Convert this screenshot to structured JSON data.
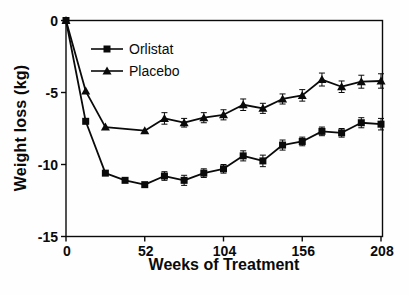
{
  "figure": {
    "background": "#fefefe",
    "ink_color": "#0a0a0a"
  },
  "axis": {
    "y_title": "Weight loss (kg)",
    "x_title": "Weeks of Treatment"
  },
  "legend": {
    "items": [
      {
        "label": "Orlistat",
        "marker": "square-marker-icon"
      },
      {
        "label": "Placebo",
        "marker": "triangle-marker-icon"
      }
    ]
  },
  "chart_data": {
    "type": "line",
    "title": "",
    "xlabel": "Weeks of Treatment",
    "ylabel": "Weight loss (kg)",
    "xlim": [
      0,
      208
    ],
    "ylim": [
      -15,
      0
    ],
    "xticks": [
      0,
      52,
      104,
      156,
      208
    ],
    "yticks": [
      0,
      -5,
      -10,
      -15
    ],
    "grid": false,
    "legend_position": "inside top-left",
    "error_bars": true,
    "series": [
      {
        "name": "Orlistat",
        "marker": "square",
        "color": "#0a0a0a",
        "x": [
          0,
          13,
          26,
          39,
          52,
          65,
          78,
          91,
          104,
          117,
          130,
          143,
          156,
          169,
          182,
          195,
          208
        ],
        "y": [
          0,
          -7.0,
          -10.6,
          -11.1,
          -11.4,
          -10.8,
          -11.1,
          -10.6,
          -10.3,
          -9.4,
          -9.75,
          -8.65,
          -8.4,
          -7.7,
          -7.8,
          -7.1,
          -7.2
        ],
        "yerr": [
          0,
          0,
          0,
          0,
          0,
          0.3,
          0.35,
          0.3,
          0.3,
          0.35,
          0.4,
          0.35,
          0.3,
          0.3,
          0.3,
          0.35,
          0.4
        ]
      },
      {
        "name": "Placebo",
        "marker": "triangle",
        "color": "#0a0a0a",
        "x": [
          0,
          13,
          26,
          52,
          65,
          78,
          91,
          104,
          117,
          130,
          143,
          156,
          169,
          182,
          195,
          208
        ],
        "y": [
          0,
          -4.9,
          -7.4,
          -7.65,
          -6.8,
          -7.1,
          -6.75,
          -6.55,
          -5.85,
          -6.1,
          -5.45,
          -5.2,
          -4.1,
          -4.6,
          -4.25,
          -4.2
        ],
        "yerr": [
          0,
          0,
          0,
          0,
          0.4,
          0.3,
          0.35,
          0.35,
          0.4,
          0.35,
          0.35,
          0.4,
          0.45,
          0.4,
          0.45,
          0.5
        ]
      }
    ]
  }
}
